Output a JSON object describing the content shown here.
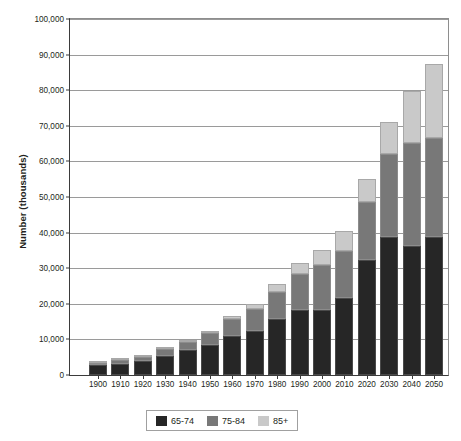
{
  "chart_data": {
    "type": "bar",
    "subtype": "stacked-bar",
    "title": "",
    "xlabel": "",
    "ylabel": "Number (thousands)",
    "ylim": [
      0,
      100000
    ],
    "ytick_labels": [
      "0",
      "10,000",
      "20,000",
      "30,000",
      "40,000",
      "50,000",
      "60,000",
      "70,000",
      "80,000",
      "90,000",
      "100,000"
    ],
    "ytick_values": [
      0,
      10000,
      20000,
      30000,
      40000,
      50000,
      60000,
      70000,
      80000,
      90000,
      100000
    ],
    "grid": true,
    "legend_position": "bottom",
    "categories": [
      "1900",
      "1910",
      "1920",
      "1930",
      "1940",
      "1950",
      "1960",
      "1970",
      "1980",
      "1990",
      "2000",
      "2010",
      "2020",
      "2030",
      "2040",
      "2050"
    ],
    "series": [
      {
        "name": "65-74",
        "color": "#262626",
        "values": [
          2700,
          3000,
          3800,
          5400,
          6900,
          8400,
          11000,
          12400,
          15600,
          18400,
          18400,
          21700,
          32300,
          38800,
          36300,
          38900
        ]
      },
      {
        "name": "75-84",
        "color": "#787878",
        "values": [
          800,
          1100,
          1300,
          1800,
          2300,
          3300,
          4600,
          6100,
          7700,
          10100,
          12400,
          13000,
          16400,
          23300,
          29000,
          27600
        ]
      },
      {
        "name": "85+",
        "color": "#c9c9c9",
        "values": [
          100,
          200,
          200,
          300,
          400,
          600,
          900,
          1400,
          2200,
          3100,
          4200,
          5800,
          6500,
          9100,
          14600,
          20900
        ]
      }
    ],
    "totals": [
      3600,
      4300,
      5300,
      7500,
      9600,
      12300,
      16500,
      19900,
      25500,
      31600,
      35000,
      40500,
      55200,
      71200,
      79900,
      87400
    ]
  },
  "legend": {
    "entries": [
      {
        "label": "65-74",
        "swatch": "legend-swatch-65-74"
      },
      {
        "label": "75-84",
        "swatch": "legend-swatch-75-84"
      },
      {
        "label": "85+",
        "swatch": "legend-swatch-85-plus"
      }
    ]
  }
}
